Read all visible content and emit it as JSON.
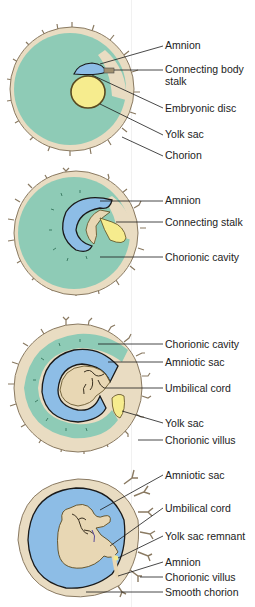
{
  "colors": {
    "chorion": "#e9dcc2",
    "chorion_edge": "#8a7a62",
    "chorionic_cavity": "#8ecbb6",
    "amniotic": "#8dbde6",
    "yolk": "#f6ec8e",
    "embryo": "#e8d7b4",
    "line": "#1a1a1a"
  },
  "stages": [
    {
      "labels": [
        {
          "text": "Amnion",
          "y": 40
        },
        {
          "text": "Connecting body",
          "y": 64
        },
        {
          "text": "stalk",
          "y": 76
        },
        {
          "text": "Embryonic disc",
          "y": 103
        },
        {
          "text": "Yolk sac",
          "y": 129
        },
        {
          "text": "Chorion",
          "y": 150
        }
      ]
    },
    {
      "labels": [
        {
          "text": "Amnion",
          "y": 195
        },
        {
          "text": "Connecting stalk",
          "y": 217
        },
        {
          "text": "Chorionic cavity",
          "y": 252
        }
      ]
    },
    {
      "labels": [
        {
          "text": "Chorionic cavity",
          "y": 339
        },
        {
          "text": "Amniotic sac",
          "y": 357
        },
        {
          "text": "Umbilical cord",
          "y": 383
        },
        {
          "text": "Yolk sac",
          "y": 418
        },
        {
          "text": "Chorionic villus",
          "y": 435
        }
      ]
    },
    {
      "labels": [
        {
          "text": "Amniotic sac",
          "y": 470
        },
        {
          "text": "Umbilical cord",
          "y": 503
        },
        {
          "text": "Yolk sac remnant",
          "y": 531
        },
        {
          "text": "Amnion",
          "y": 557
        },
        {
          "text": "Chorionic villus",
          "y": 572
        },
        {
          "text": "Smooth chorion",
          "y": 587
        }
      ]
    }
  ]
}
